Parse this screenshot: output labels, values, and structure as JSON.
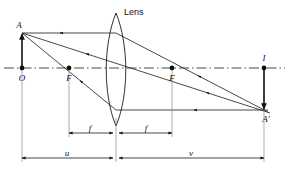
{
  "diagram": {
    "labels": {
      "lens": "Lens",
      "object_tip": "A",
      "object_base": "O",
      "focal_left": "F",
      "focal_right": "F",
      "image_base": "I",
      "image_tip": "A'",
      "focal_length_left": "f",
      "focal_length_right": "f",
      "object_distance": "u",
      "image_distance": "v"
    },
    "colors": {
      "ink": "#1a1a1a",
      "ink_strong": "#111111",
      "extension": "#8a8a8a",
      "background": "#ffffff"
    },
    "geometry": {
      "axis_y": 68,
      "lens_center_x": 116,
      "object_base_x": 22,
      "object_tip_y": 33,
      "focal_left_x": 69,
      "focal_right_x": 172,
      "image_base_x": 264,
      "image_tip_y": 110,
      "lens_top_y": 13,
      "lens_bottom_y": 126,
      "dim_f_y": 133,
      "dim_uv_y": 158
    }
  }
}
